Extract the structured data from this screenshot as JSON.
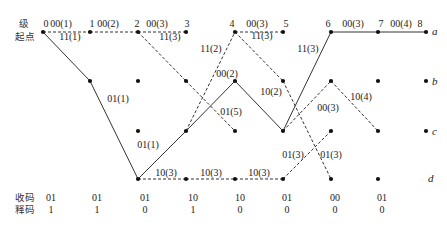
{
  "diagram": {
    "stage_heading": "级",
    "start_heading": "起点",
    "stages": [
      "0",
      "1",
      "2",
      "3",
      "4",
      "5",
      "6",
      "7",
      "8"
    ],
    "states": [
      "a",
      "b",
      "c",
      "d"
    ],
    "nodes": {
      "0": [
        "a"
      ],
      "1": [
        "a",
        "b"
      ],
      "2": [
        "a",
        "b",
        "c",
        "d"
      ],
      "3": [
        "a",
        "b",
        "c",
        "d"
      ],
      "4": [
        "a",
        "b",
        "c",
        "d"
      ],
      "5": [
        "a",
        "b",
        "c",
        "d"
      ],
      "6": [
        "a",
        "b",
        "c",
        "d"
      ],
      "7": [
        "a",
        "b",
        "c",
        "d"
      ],
      "8": [
        "a",
        "b",
        "c"
      ]
    },
    "branches": [
      {
        "from": [
          0,
          "a"
        ],
        "to": [
          1,
          "b"
        ],
        "style": "solid"
      },
      {
        "from": [
          1,
          "b"
        ],
        "to": [
          2,
          "d"
        ],
        "style": "solid"
      },
      {
        "from": [
          2,
          "d"
        ],
        "to": [
          3,
          "c"
        ],
        "style": "solid"
      },
      {
        "from": [
          3,
          "c"
        ],
        "to": [
          4,
          "b"
        ],
        "style": "solid"
      },
      {
        "from": [
          4,
          "b"
        ],
        "to": [
          5,
          "c"
        ],
        "style": "solid"
      },
      {
        "from": [
          5,
          "c"
        ],
        "to": [
          6,
          "a"
        ],
        "style": "solid"
      },
      {
        "from": [
          6,
          "a"
        ],
        "to": [
          7,
          "a"
        ],
        "style": "solid"
      },
      {
        "from": [
          7,
          "a"
        ],
        "to": [
          8,
          "a"
        ],
        "style": "solid"
      },
      {
        "from": [
          0,
          "a"
        ],
        "to": [
          1,
          "a"
        ],
        "style": "dashed"
      },
      {
        "from": [
          1,
          "a"
        ],
        "to": [
          2,
          "a"
        ],
        "style": "dashed"
      },
      {
        "from": [
          2,
          "a"
        ],
        "to": [
          3,
          "a"
        ],
        "style": "dashed"
      },
      {
        "from": [
          2,
          "a"
        ],
        "to": [
          3,
          "b"
        ],
        "style": "dashed"
      },
      {
        "from": [
          3,
          "b"
        ],
        "to": [
          4,
          "c"
        ],
        "style": "dashed"
      },
      {
        "from": [
          3,
          "c"
        ],
        "to": [
          4,
          "a"
        ],
        "style": "dashed"
      },
      {
        "from": [
          4,
          "a"
        ],
        "to": [
          5,
          "a"
        ],
        "style": "dashed"
      },
      {
        "from": [
          4,
          "a"
        ],
        "to": [
          5,
          "b"
        ],
        "style": "dashed"
      },
      {
        "from": [
          5,
          "b"
        ],
        "to": [
          6,
          "d"
        ],
        "style": "dashed"
      },
      {
        "from": [
          2,
          "d"
        ],
        "to": [
          3,
          "d"
        ],
        "style": "dashed"
      },
      {
        "from": [
          3,
          "d"
        ],
        "to": [
          4,
          "d"
        ],
        "style": "dashed"
      },
      {
        "from": [
          4,
          "d"
        ],
        "to": [
          5,
          "d"
        ],
        "style": "dashed"
      },
      {
        "from": [
          5,
          "d"
        ],
        "to": [
          6,
          "c"
        ],
        "style": "dashed"
      },
      {
        "from": [
          5,
          "c"
        ],
        "to": [
          6,
          "b"
        ],
        "style": "dashed"
      },
      {
        "from": [
          6,
          "b"
        ],
        "to": [
          7,
          "c"
        ],
        "style": "dashed"
      }
    ],
    "branch_labels": [
      "00(1)",
      "11(1)",
      "00(2)",
      "00(3)",
      "11(3)",
      "01(1)",
      "01(1)",
      "11(2)",
      "00(2)",
      "01(5)",
      "00(3)",
      "11(3)",
      "10(2)",
      "11(3)",
      "00(3)",
      "01(3)",
      "01(3)",
      "10(3)",
      "10(3)",
      "10(3)",
      "00(3)",
      "10(4)",
      "00(4)"
    ]
  },
  "footer": {
    "received_label": "收码",
    "received": [
      "01",
      "01",
      "01",
      "10",
      "10",
      "01",
      "00",
      "01"
    ],
    "decoded_label": "释码",
    "decoded": [
      "1",
      "1",
      "0",
      "1",
      "0",
      "0",
      "0",
      "0"
    ]
  }
}
